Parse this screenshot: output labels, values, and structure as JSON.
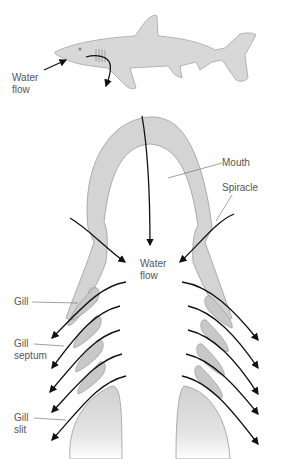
{
  "diagram": {
    "colors": {
      "tissue": "#d4d4d4",
      "tissue_stroke": "#9a9a9a",
      "arrow": "#111111",
      "label": "#555555",
      "leader": "#777777"
    },
    "shark_inset": {
      "label_line1": "Water",
      "label_line2": "flow"
    },
    "labels": {
      "mouth": "Mouth",
      "spiracle": "Spiracle",
      "water_flow_line1": "Water",
      "water_flow_line2": "flow",
      "gill": "Gill",
      "gill_septum_line1": "Gill",
      "gill_septum_line2": "septum",
      "gill_slit_line1": "Gill",
      "gill_slit_line2": "slit"
    }
  }
}
